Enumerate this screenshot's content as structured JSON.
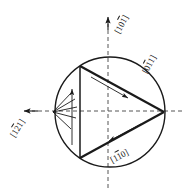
{
  "figure": {
    "type": "stereographic-projection-diagram",
    "background_color": "#ffffff",
    "line_color": "#1a1a1a",
    "dashed_color": "#555555"
  },
  "geometry": {
    "circle": {
      "cx": 110,
      "cy": 112,
      "r": 55
    },
    "triangle": {
      "vertices": [
        {
          "name": "top-left",
          "x": 80,
          "y": 66
        },
        {
          "name": "bottom-left",
          "x": 80,
          "y": 158
        },
        {
          "name": "right",
          "x": 164,
          "y": 112
        }
      ]
    },
    "axes": {
      "vertical": {
        "x1": 108,
        "y1": 18,
        "x2": 108,
        "y2": 188
      },
      "horizontal": {
        "x1": 22,
        "y1": 111,
        "x2": 182,
        "y2": 111
      }
    },
    "hatch_origin": {
      "x": 53,
      "y": 112
    },
    "hatch_count": 5
  },
  "labels": {
    "top": {
      "name": "direction-101-bar",
      "open": "[",
      "d1": "1",
      "d2": "0",
      "d3": "1",
      "d3_bar": true,
      "d2_bar": false,
      "d1_bar": false,
      "close": "]"
    },
    "right": {
      "name": "direction-0-1bar-1",
      "open": "[",
      "d1": "0",
      "d2": "1",
      "d3": "1",
      "d3_bar": false,
      "d2_bar": true,
      "d1_bar": false,
      "close": "]"
    },
    "bottom": {
      "name": "direction-1-1bar-0",
      "open": "[",
      "d1": "1",
      "d2": "1",
      "d3": "0",
      "d3_bar": false,
      "d2_bar": true,
      "d1_bar": false,
      "close": "]"
    },
    "left": {
      "name": "direction-1-2bar-1",
      "open": "[",
      "d1": "1",
      "d2": "2",
      "d3": "1",
      "d3_bar": false,
      "d2_bar": true,
      "d1_bar": false,
      "close": "]"
    }
  },
  "label_text": {
    "top": "[101]",
    "right": "[011]",
    "bottom": "[110]",
    "left": "[121]"
  },
  "arrows": {
    "axis_up": {
      "name": "vertical-axis-arrow",
      "direction": "up",
      "tip_x": 108,
      "tip_y": 18
    },
    "axis_left": {
      "name": "horizontal-axis-arrow",
      "direction": "left",
      "tip_x": 23,
      "tip_y": 111
    },
    "burgers_vertical": {
      "name": "vertical-slip-arrow",
      "direction": "up",
      "tip_x": 72,
      "tip_y": 88
    },
    "burgers_upper_edge": {
      "name": "upper-edge-slip-arrow",
      "direction": "down-right",
      "tip_x": 127,
      "tip_y": 97
    },
    "burgers_lower_edge": {
      "name": "lower-edge-slip-arrow",
      "direction": "up-right",
      "tip_x": 110,
      "tip_y": 142
    }
  }
}
